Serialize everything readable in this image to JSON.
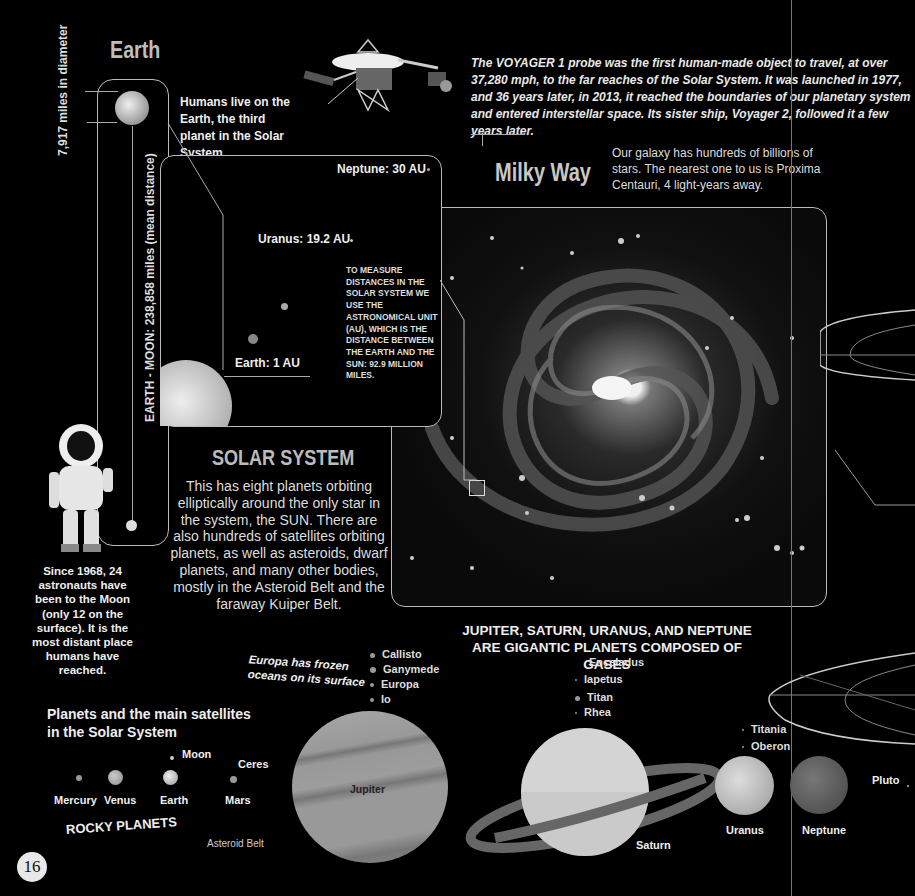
{
  "page": {
    "page_number": "16",
    "background": "#000000"
  },
  "earth": {
    "title": "Earth",
    "diameter_label": "7,917 miles in diameter",
    "description": "Humans live on the Earth, the third planet in the Solar System.",
    "moon_distance_label": "EARTH - MOON: 238,858 miles (mean distance)"
  },
  "voyager": {
    "icon": "voyager-probe-icon",
    "text": "The VOYAGER 1 probe was the first human-made object to travel, at over 37,280 mph, to the far reaches of the Solar System. It was launched in 1977, and 36 years later, in 2013, it reached the boundaries of our planetary system and entered interstellar space. Its sister ship, Voyager 2, followed it a few years later."
  },
  "milky_way": {
    "title": "Milky Way",
    "text": "Our galaxy has hundreds of billions of stars. The nearest one to us is Proxima Centauri, 4 light-years away."
  },
  "distances": {
    "neptune": "Neptune: 30 AU",
    "uranus": "Uranus: 19.2 AU",
    "earth": "Earth: 1 AU",
    "au_note": "TO MEASURE DISTANCES IN THE SOLAR SYSTEM WE USE THE ASTRONOMICAL UNIT (AU), WHICH IS THE DISTANCE BETWEEN THE EARTH AND THE SUN: 92.9 MILLION MILES."
  },
  "solar_system": {
    "title": "SOLAR SYSTEM",
    "text": "This has eight planets orbiting elliptically around the only star in the system, the SUN. There are also hundreds of satellites orbiting planets, as well as asteroids, dwarf planets, and many other bodies, mostly in the Asteroid Belt and the faraway Kuiper Belt."
  },
  "astronaut": {
    "icon": "astronaut-icon",
    "text": "Since 1968, 24 astronauts have been to the Moon (only 12 on the surface). It is the most distant place humans have reached."
  },
  "planets_section": {
    "title": "Planets and the main satellites in the Solar System",
    "rocky_label": "ROCKY PLANETS",
    "asteroid_belt": "Asteroid Belt",
    "rocky": [
      "Mercury",
      "Venus",
      "Earth",
      "Mars"
    ],
    "moon": "Moon",
    "ceres": "Ceres",
    "gas_title": "JUPITER, SATURN, URANUS, AND NEPTUNE ARE GIGANTIC PLANETS COMPOSED OF GASES",
    "europa_note": "Europa has frozen oceans on its surface",
    "jupiter": "Jupiter",
    "jupiter_moons": [
      "Callisto",
      "Ganymede",
      "Europa",
      "Io"
    ],
    "saturn": "Saturn",
    "saturn_moons": [
      "Enceladus",
      "Iapetus",
      "Titan",
      "Rhea"
    ],
    "uranus": "Uranus",
    "uranus_moons": [
      "Titania",
      "Oberon"
    ],
    "neptune": "Neptune",
    "pluto": "Pluto"
  }
}
